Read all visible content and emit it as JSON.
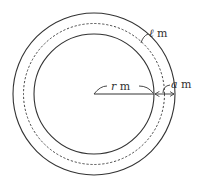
{
  "diagram": {
    "type": "concentric-circles-track",
    "center": {
      "x": 94,
      "y": 94
    },
    "circles": {
      "outer_radius": 81,
      "middle_dashed_radius": 70.5,
      "inner_radius": 60
    },
    "labels": {
      "length": {
        "var": "ℓ",
        "unit": " m"
      },
      "radius": {
        "var": "r",
        "unit": " m"
      },
      "width": {
        "var": "a",
        "unit": " m"
      }
    },
    "colors": {
      "stroke": "#333333",
      "background": "#ffffff"
    }
  }
}
